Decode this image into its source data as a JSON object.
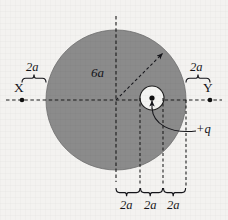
{
  "figure": {
    "type": "physics-diagram",
    "background_color": "#f3f2f0",
    "disk_fill_color": "#8b8b8b",
    "cavity_fill_color": "#f4f4f2",
    "line_color": "#1a1a1a"
  },
  "labels": {
    "radius": "6a",
    "charge": "+q",
    "point_left": "X",
    "point_right": "Y",
    "dim_left": "2a",
    "dim_right": "2a",
    "dim_bottom_1": "2a",
    "dim_bottom_2": "2a",
    "dim_bottom_3": "2a"
  },
  "geometry": {
    "disk": {
      "cx": 116,
      "cy": 100,
      "r": 70,
      "label": "6a"
    },
    "cavity": {
      "cx": 152,
      "cy": 98,
      "r": 12
    },
    "charge_dot": {
      "cx": 152,
      "cy": 98
    },
    "point_x_dot": {
      "cx": 22,
      "cy": 100
    },
    "point_y_dot": {
      "cx": 210,
      "cy": 100
    },
    "vertical_guides_x": [
      116,
      140,
      163,
      186
    ],
    "horizontal_axis_y": 100,
    "vertical_axis_x": 116
  }
}
